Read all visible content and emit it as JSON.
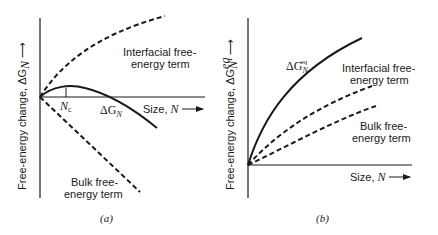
{
  "panel_a": {
    "y_axis_label": "Free-energy change, ΔG",
    "y_axis_sub": "N",
    "x_axis_label": "Size, ",
    "x_axis_symbol": "N",
    "interfacial_line1": "Interfacial free-",
    "interfacial_line2": "energy term",
    "bulk_line1": "Bulk free-",
    "bulk_line2": "energy term",
    "critical_label": "N",
    "critical_sub": "c",
    "curve_label": "ΔG",
    "curve_sub": "N",
    "caption": "(a)"
  },
  "panel_b": {
    "y_axis_label": "Free-energy change, ΔG",
    "y_axis_sub": "N",
    "y_axis_sup": "eq",
    "x_axis_label": "Size, ",
    "x_axis_symbol": "N",
    "interfacial_line1": "Interfacial free-",
    "interfacial_line2": "energy term",
    "bulk_line1": "Bulk free-",
    "bulk_line2": "energy term",
    "curve_label": "ΔG",
    "curve_sub": "N",
    "curve_sup": "eq",
    "caption": "(b)"
  },
  "colors": {
    "ink": "#1a1a1a",
    "background": "#ffffff"
  }
}
